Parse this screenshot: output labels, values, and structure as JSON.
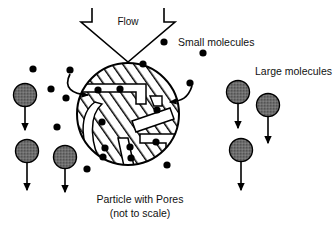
{
  "figure": {
    "title_caption_line1": "Particle with Pores",
    "title_caption_line2": "(not to scale)",
    "flow_label": "Flow",
    "legend": {
      "small_label": "Small molecules",
      "large_label": "Large molecules"
    },
    "colors": {
      "stroke": "#000000",
      "large_molecule_fill": "#6e6e6e",
      "small_molecule_fill": "#000000",
      "pore_fill": "#ffffff",
      "background": "#ffffff",
      "hatch": "#000000"
    },
    "particle": {
      "center_x": 128,
      "center_y": 114,
      "radius": 51
    },
    "legend_markers": {
      "small_dot": {
        "cx": 164,
        "cy": 42,
        "r": 3.6
      },
      "large_dot": {
        "cx": 238,
        "cy": 92,
        "r": 11.5
      }
    },
    "large_molecules": [
      {
        "cx": 25,
        "cy": 95,
        "r": 11.5,
        "arrow_to": 130
      },
      {
        "cx": 27,
        "cy": 151,
        "r": 11.5,
        "arrow_to": 190
      },
      {
        "cx": 65,
        "cy": 157,
        "r": 11.5,
        "arrow_to": 192
      },
      {
        "cx": 238,
        "cy": 92,
        "r": 11.5,
        "arrow_to": 128
      },
      {
        "cx": 268,
        "cy": 105,
        "r": 11.5,
        "arrow_to": 143
      },
      {
        "cx": 241,
        "cy": 150,
        "r": 11.5,
        "arrow_to": 190
      }
    ],
    "small_molecules_outside": [
      {
        "cx": 33,
        "cy": 69,
        "r": 3.6
      },
      {
        "cx": 51,
        "cy": 89,
        "r": 3.6
      },
      {
        "cx": 70,
        "cy": 70,
        "r": 3.6
      },
      {
        "cx": 66,
        "cy": 98,
        "r": 3.6
      },
      {
        "cx": 57,
        "cy": 127,
        "r": 3.6
      },
      {
        "cx": 87,
        "cy": 169,
        "r": 3.6
      },
      {
        "cx": 143,
        "cy": 64,
        "r": 3.6
      },
      {
        "cx": 203,
        "cy": 53,
        "r": 3.6
      },
      {
        "cx": 190,
        "cy": 83,
        "r": 3.6
      },
      {
        "cx": 164,
        "cy": 42,
        "r": 3.6
      }
    ],
    "small_molecules_inside": [
      {
        "cx": 98,
        "cy": 90,
        "r": 3.6
      },
      {
        "cx": 120,
        "cy": 89,
        "r": 3.6
      },
      {
        "cx": 102,
        "cy": 122,
        "r": 3.6
      },
      {
        "cx": 157,
        "cy": 110,
        "r": 3.6
      },
      {
        "cx": 156,
        "cy": 142,
        "r": 3.6
      },
      {
        "cx": 105,
        "cy": 148,
        "r": 3.6
      },
      {
        "cx": 103,
        "cy": 157,
        "r": 3.6
      },
      {
        "cx": 130,
        "cy": 147,
        "r": 3.6
      },
      {
        "cx": 131,
        "cy": 158,
        "r": 3.6
      },
      {
        "cx": 167,
        "cy": 165,
        "r": 3.6
      }
    ]
  }
}
